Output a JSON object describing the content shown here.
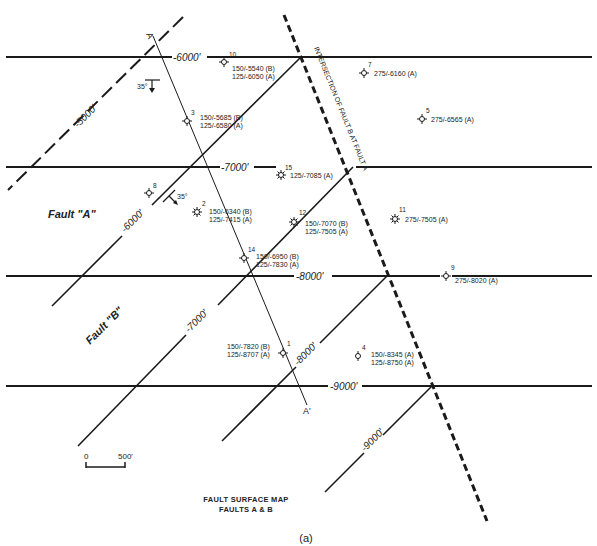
{
  "map": {
    "title_line1": "FAULT SURFACE MAP",
    "title_line2": "FAULTS A & B",
    "caption": "(a)",
    "scale_bar": {
      "start": "0",
      "end": "500'"
    },
    "fault_labels": {
      "fault_a": "Fault \"A\"",
      "fault_b": "Fault \"B\""
    },
    "intersection_label": "INTERSECTION OF FAULT B AT FAULT A",
    "section_line": {
      "start": "A",
      "end": "A'"
    },
    "dip_symbols": [
      {
        "value": "35°"
      },
      {
        "value": "35°"
      }
    ],
    "horizontal_contours": [
      {
        "label": "-6000'"
      },
      {
        "label": "-7000'"
      },
      {
        "label": "-8000'"
      },
      {
        "label": "-9000'"
      }
    ],
    "diagonal_contours": [
      {
        "label": "-5000'",
        "style": "dashed"
      },
      {
        "label": "-6000'"
      },
      {
        "label": "-7000'"
      },
      {
        "label": "-8000'"
      },
      {
        "label": "-9000'"
      }
    ],
    "wells": [
      {
        "id": "10",
        "line1": "150/-5540 (B)",
        "line2": "125/-6050 (A)"
      },
      {
        "id": "7",
        "line1": "275/-6160 (A)",
        "line2": ""
      },
      {
        "id": "3",
        "line1": "150/-5685 (B)",
        "line2": "125/-6580 (A)"
      },
      {
        "id": "5",
        "line1": "275/-6565 (A)",
        "line2": ""
      },
      {
        "id": "15",
        "line1": "125/-7085 (A)",
        "line2": ""
      },
      {
        "id": "8",
        "line1": "",
        "line2": ""
      },
      {
        "id": "2",
        "line1": "150/-6340 (B)",
        "line2": "125/-7415 (A)"
      },
      {
        "id": "12",
        "line1": "150/-7070 (B)",
        "line2": "125/-7505 (A)"
      },
      {
        "id": "11",
        "line1": "275/-7505 (A)",
        "line2": ""
      },
      {
        "id": "14",
        "line1": "150/-6950 (B)",
        "line2": "125/-7830 (A)"
      },
      {
        "id": "9",
        "line1": "275/-8020 (A)",
        "line2": ""
      },
      {
        "id": "1",
        "line1": "150/-7820 (B)",
        "line2": "125/-8707 (A)"
      },
      {
        "id": "4",
        "line1": "150/-8345 (A)",
        "line2": "125/-8750 (A)"
      }
    ],
    "colors": {
      "ink": "#1a1a1a",
      "background": "#ffffff"
    }
  }
}
